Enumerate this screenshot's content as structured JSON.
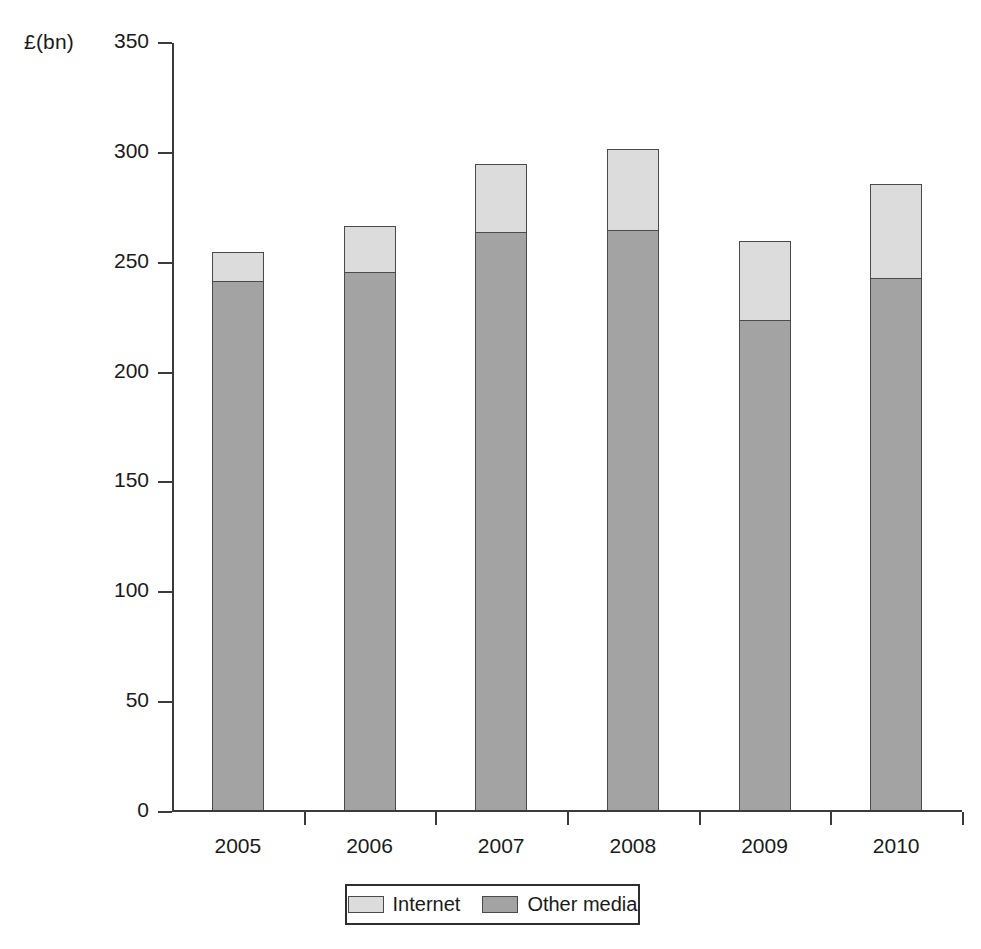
{
  "chart_data": {
    "type": "bar",
    "subtype": "stacked-bar",
    "title": "",
    "subtitle": "",
    "xlabel": "",
    "ylabel": "£(bn)",
    "categories": [
      "2005",
      "2006",
      "2007",
      "2008",
      "2009",
      "2010"
    ],
    "series": [
      {
        "name": "Other media",
        "color": "#a3a3a3",
        "values": [
          241,
          245,
          263,
          264,
          223,
          242
        ]
      },
      {
        "name": "Internet",
        "color": "#dcdcdc",
        "values": [
          13,
          21,
          31,
          37,
          36,
          43
        ]
      }
    ],
    "totals": [
      254,
      266,
      294,
      301,
      259,
      285
    ],
    "stack_order_bottom_to_top": [
      "Other media",
      "Internet"
    ],
    "ylim": [
      0,
      350
    ],
    "ytick_step": 50,
    "yticks": [
      0,
      50,
      100,
      150,
      200,
      250,
      300,
      350
    ],
    "ytick_labels": [
      "0",
      "50",
      "100",
      "150",
      "200",
      "250",
      "300",
      "350"
    ],
    "grid": false,
    "legend_position": "bottom-center",
    "legend_entries": [
      {
        "label": "Internet",
        "color": "#dcdcdc"
      },
      {
        "label": "Other media",
        "color": "#a3a3a3"
      }
    ],
    "axis_color": "#3b3b3b",
    "bar_border_color": "#4a4a4a",
    "background_color": "#ffffff"
  }
}
